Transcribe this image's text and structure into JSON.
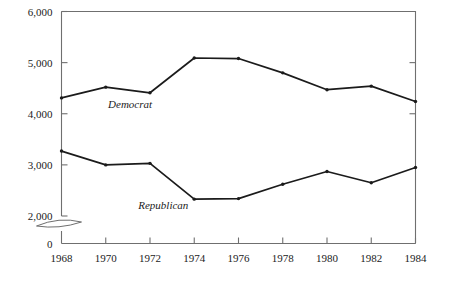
{
  "chart_data": {
    "type": "line",
    "title": "",
    "subtitle": "",
    "xlabel": "",
    "ylabel": "",
    "x": [
      1968,
      1970,
      1972,
      1974,
      1976,
      1978,
      1980,
      1982,
      1984
    ],
    "xticklabels": [
      "1968",
      "1970",
      "1972",
      "1974",
      "1976",
      "1978",
      "1980",
      "1982",
      "1984"
    ],
    "yticks": [
      0,
      2000,
      3000,
      4000,
      5000,
      6000
    ],
    "yticklabels": [
      "0",
      "2,000",
      "3,000",
      "4,000",
      "5,000",
      "6,000"
    ],
    "ylim": [
      0,
      6000
    ],
    "xlim": [
      1968,
      1984
    ],
    "axis_break": true,
    "axis_break_between": [
      0,
      2000
    ],
    "grid": false,
    "legend_position": "inline-annotation",
    "series": [
      {
        "name": "Democrat",
        "label": "Democrat",
        "color": "#1b1b1b",
        "marker": "dot",
        "values": [
          4310,
          4520,
          4410,
          5090,
          5080,
          4800,
          4470,
          4540,
          4240
        ]
      },
      {
        "name": "Republican",
        "label": "Republican",
        "color": "#1b1b1b",
        "marker": "dot",
        "values": [
          3270,
          3000,
          3030,
          2330,
          2340,
          2620,
          2870,
          2650,
          2950
        ]
      }
    ],
    "annotations": [
      {
        "text": "Democrat",
        "x": 1971.1,
        "y": 4120,
        "style": "italic"
      },
      {
        "text": "Republican",
        "x": 1972.6,
        "y": 2140,
        "style": "italic"
      }
    ]
  },
  "colors": {
    "line": "#1b1b1b",
    "frame": "#6f6f6f",
    "text": "#1b1b1b",
    "background": "#ffffff"
  }
}
